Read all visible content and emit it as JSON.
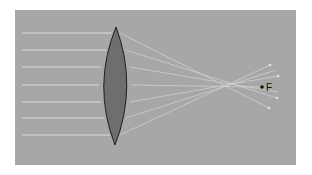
{
  "diagram": {
    "colors": {
      "page_bg": "#ffffff",
      "panel_bg": "#a7a7a7",
      "lens_fill": "#6e6e6e",
      "lens_stroke": "#1e1e1e",
      "ray_color": "#dcdcdc",
      "focus_dot": "#111111"
    },
    "panel": {
      "x": 15,
      "y": 10,
      "w": 281,
      "h": 155
    },
    "lens": {
      "top": [
        116,
        27
      ],
      "bottom": [
        115,
        145
      ],
      "left_x": 99,
      "right_x": 131,
      "center_y": 85
    },
    "incident_rays_y": [
      33,
      50,
      67,
      85,
      102,
      118,
      135
    ],
    "ray_start_x": 22,
    "focal_point": {
      "x": 262,
      "y": 87,
      "label": "F"
    },
    "ray_end_points": [
      [
        270,
        65
      ],
      [
        278,
        76
      ],
      [
        262,
        87
      ],
      [
        277,
        98
      ],
      [
        269,
        108
      ]
    ]
  }
}
